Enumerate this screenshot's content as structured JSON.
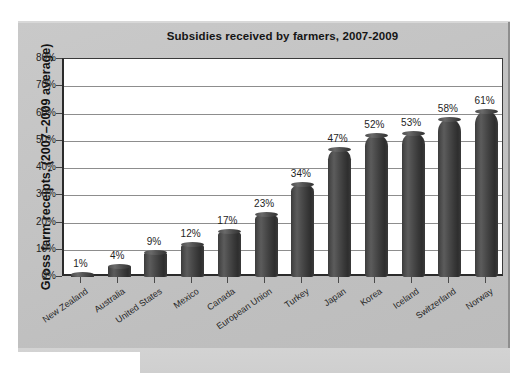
{
  "chart_data": {
    "type": "bar",
    "title": "Subsidies received by farmers, 2007-2009",
    "xlabel": "",
    "ylabel": "Gross farm receipts, (2007–2009 average)",
    "ylim": [
      0,
      80
    ],
    "ytick_labels": [
      "80%",
      "70%",
      "60%",
      "50%",
      "40%",
      "30%",
      "20%",
      "10%",
      "0%"
    ],
    "yticks": [
      80,
      70,
      60,
      50,
      40,
      30,
      20,
      10,
      0
    ],
    "grid": true,
    "legend": "none",
    "categories": [
      "New Zealand",
      "Australia",
      "United States",
      "Mexico",
      "Canada",
      "European Union",
      "Turkey",
      "Japan",
      "Korea",
      "Iceland",
      "Switzerland",
      "Norway"
    ],
    "values": [
      1,
      4,
      9,
      12,
      17,
      23,
      34,
      47,
      52,
      53,
      58,
      61
    ],
    "value_labels": [
      "1%",
      "4%",
      "9%",
      "12%",
      "17%",
      "23%",
      "34%",
      "47%",
      "52%",
      "53%",
      "58%",
      "61%"
    ],
    "colors": {
      "bar": "#454545",
      "panel_background": "#c4c4c4",
      "plot_background": "#ffffff",
      "gridline": "#8d8d8d",
      "axis": "#2b2b2b",
      "text": "#1e1e1e"
    }
  }
}
